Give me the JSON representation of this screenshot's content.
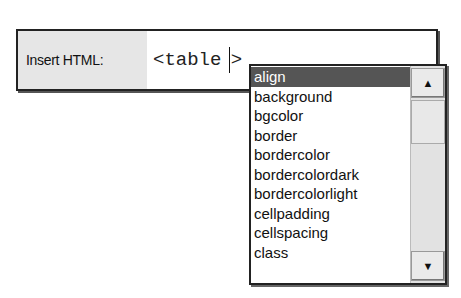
{
  "insert": {
    "label": "Insert HTML:",
    "value": "<table ",
    "suffix": ">"
  },
  "dropdown": {
    "items": [
      {
        "label": "align",
        "selected": true
      },
      {
        "label": "background"
      },
      {
        "label": "bgcolor"
      },
      {
        "label": "border"
      },
      {
        "label": "bordercolor"
      },
      {
        "label": "bordercolordark"
      },
      {
        "label": "bordercolorlight"
      },
      {
        "label": "cellpadding"
      },
      {
        "label": "cellspacing"
      },
      {
        "label": "class"
      }
    ],
    "scroll_up_icon": "▲",
    "scroll_down_icon": "▼"
  }
}
